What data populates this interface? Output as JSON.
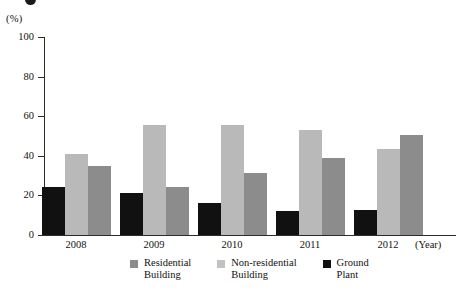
{
  "chart_data": {
    "type": "bar",
    "title": "",
    "xlabel": "(Year)",
    "ylabel": "(%)",
    "ylim": [
      0,
      100
    ],
    "ytick_labels": [
      "100",
      "80",
      "60",
      "40",
      "20",
      "0"
    ],
    "ytick_values": [
      100,
      80,
      60,
      40,
      20,
      0
    ],
    "grid": false,
    "legend_position": "bottom",
    "categories": [
      "2008",
      "2009",
      "2010",
      "2011",
      "2012"
    ],
    "series": [
      {
        "name": "Ground Plant",
        "color": "#111111",
        "values": [
          24,
          21,
          16,
          12,
          12.5
        ]
      },
      {
        "name": "Non-residential Building",
        "color": "#b9b9b9",
        "values": [
          41,
          55.5,
          55.5,
          53,
          43.5
        ]
      },
      {
        "name": "Residential Building",
        "color": "#8c8c8c",
        "values": [
          35,
          24,
          31.5,
          39,
          50.5
        ]
      }
    ],
    "bar_order": [
      "Ground Plant",
      "Non-residential Building",
      "Residential Building"
    ]
  },
  "axis": {
    "unit_label": "(%)",
    "year_unit": "(Year)"
  },
  "legend": {
    "items": [
      {
        "label": "Residential\nBuilding",
        "swatch": "res"
      },
      {
        "label": "Non-residential\nBuilding",
        "swatch": "nonres"
      },
      {
        "label": "Ground\nPlant",
        "swatch": "ground"
      }
    ]
  }
}
